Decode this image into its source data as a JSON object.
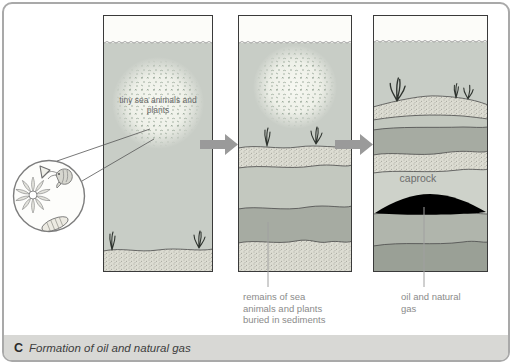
{
  "figure": {
    "caption_letter": "C",
    "caption_text": "Formation of oil and natural gas"
  },
  "stage1": {
    "cloud_label": "tiny sea animals and plants"
  },
  "stage2": {
    "label": "remains of sea animals and plants buried in sediments"
  },
  "stage3": {
    "caprock_label": "caprock",
    "oil_label": "oil and natural gas"
  },
  "inset": {
    "organisms": [
      "radiolarian-icon",
      "shrimp-icon",
      "diatom-icon",
      "triangle-shell-icon"
    ]
  },
  "colors": {
    "water": "#c8cdc6",
    "sky": "#fcfcf9",
    "sediment_stipple": "#dcdcd2",
    "layer_light": "#c3c8bf",
    "layer_dark": "#a6aba2",
    "caprock": "#ced2ca",
    "oil": "#000000",
    "arrow": "#9a9a9a",
    "caption_bar": "#d8d8d5"
  }
}
